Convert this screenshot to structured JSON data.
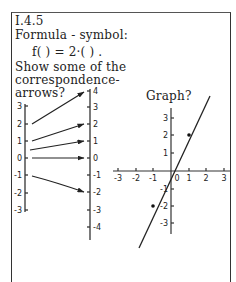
{
  "card": {
    "id": "I.4.5",
    "heading": "Formula - symbol:",
    "formula": "f( )  =  2·( )  .",
    "prompt_lines": [
      "Show some of the",
      "correspondence-",
      "arrows?"
    ],
    "graph_title": "Graph?"
  },
  "mapping_diagram": {
    "left_axis_labels": [
      "3",
      "2",
      "1",
      "0",
      "-1",
      "-2",
      "-3"
    ],
    "right_axis_labels": [
      "4",
      "3",
      "2",
      "1",
      "0",
      "-1",
      "-2",
      "-3",
      "-4"
    ],
    "arrows": [
      {
        "from": 2,
        "to": 4
      },
      {
        "from": 1,
        "to": 2
      },
      {
        "from": 0.5,
        "to": 1
      },
      {
        "from": 0,
        "to": 0
      },
      {
        "from": -1,
        "to": -2
      }
    ]
  },
  "graph": {
    "x_tick_labels": [
      "-3",
      "-2",
      "-1",
      "0",
      "1",
      "2",
      "3"
    ],
    "y_tick_labels_pos": [
      "1",
      "2",
      "3"
    ],
    "y_tick_labels_neg": [
      "-1",
      "-2",
      "-3"
    ],
    "function": "y = 2x",
    "marked_points": [
      [
        1,
        2
      ],
      [
        -1,
        -2
      ]
    ]
  }
}
